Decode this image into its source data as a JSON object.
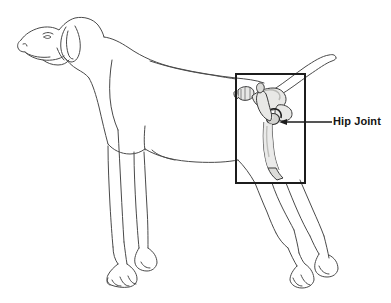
{
  "figure": {
    "title": "Hip Joint",
    "background_color": "#ffffff",
    "outline_color": "#4a4a4a",
    "bone_fill_color": "#e8e8e6",
    "bone_outline_color": "#3a3a3a",
    "bone_shade_color": "#c9c9c6",
    "callout": {
      "border_color": "#1c1c1c",
      "border_width_px": 2,
      "x": 236,
      "y": 74,
      "width": 69,
      "height": 109
    },
    "leader_line": {
      "color": "#1c1c1c",
      "from_x": 283,
      "from_y": 122,
      "to_x": 332,
      "to_y": 122,
      "arrow": "arrowhead-left"
    }
  },
  "annotations": [
    {
      "id": "hip-joint",
      "label": "Hip Joint",
      "color": "#141414"
    }
  ]
}
